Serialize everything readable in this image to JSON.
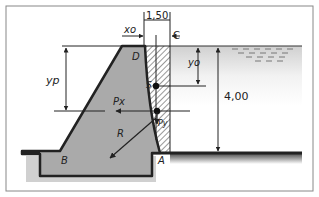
{
  "diagram": {
    "type": "gravity dam cross-section with hydrostatic forces",
    "labels": {
      "crest_left": "D",
      "crest_right": "C",
      "heel": "A",
      "toe": "B",
      "centroid": "S",
      "resultant": "R",
      "horizontal_force": "Px",
      "vertical_force": "Py",
      "xo": "xo",
      "yo": "yo",
      "yp": "yp"
    },
    "dimensions": {
      "top_width": "1,50",
      "water_height": "4,00"
    },
    "colors": {
      "dam_fill": "#aaaaaa",
      "outline": "#222222",
      "water_gradient": "#d8d8d8",
      "border": "#888888"
    }
  }
}
